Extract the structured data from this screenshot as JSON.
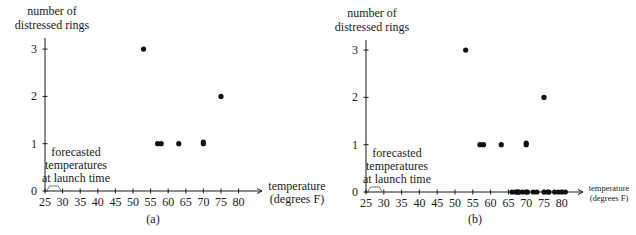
{
  "figure": {
    "panels": [
      {
        "caption": "(a)",
        "ylabel_lines": [
          "number of",
          "distressed rings"
        ],
        "xlabel_lines": [
          "temperature",
          "(degrees F)"
        ],
        "annotation_lines": [
          "forecasted",
          "temperatures",
          "at launch time"
        ],
        "forecast_range": [
          26,
          29
        ]
      },
      {
        "caption": "(b)",
        "ylabel_lines": [
          "number of",
          "distressed rings"
        ],
        "xlabel_lines": [
          "temperature",
          "(degrees F)"
        ],
        "annotation_lines": [
          "forecasted",
          "temperatures",
          "at launch time"
        ],
        "forecast_range": [
          26,
          29
        ]
      }
    ]
  },
  "chart_data": [
    {
      "type": "scatter",
      "title": "(a)",
      "xlabel": "temperature (degrees F)",
      "ylabel": "number of distressed rings",
      "xticks": [
        25,
        30,
        35,
        40,
        45,
        50,
        55,
        60,
        65,
        70,
        75,
        80
      ],
      "yticks": [
        0,
        1,
        2,
        3
      ],
      "xlim": [
        25,
        83
      ],
      "ylim": [
        0,
        3
      ],
      "grid": false,
      "annotation": "forecasted temperatures at launch time",
      "forecast_range": [
        26,
        29
      ],
      "points": [
        {
          "x": 53,
          "y": 3
        },
        {
          "x": 57,
          "y": 1
        },
        {
          "x": 58,
          "y": 1
        },
        {
          "x": 63,
          "y": 1
        },
        {
          "x": 70,
          "y": 1
        },
        {
          "x": 70,
          "y": 1
        },
        {
          "x": 75,
          "y": 2
        }
      ]
    },
    {
      "type": "scatter",
      "title": "(b)",
      "xlabel": "temperature (degrees F)",
      "ylabel": "number of distressed rings",
      "xticks": [
        25,
        30,
        35,
        40,
        45,
        50,
        55,
        60,
        65,
        70,
        75,
        80
      ],
      "yticks": [
        0,
        1,
        2,
        3
      ],
      "xlim": [
        25,
        83
      ],
      "ylim": [
        0,
        3
      ],
      "grid": false,
      "annotation": "forecasted temperatures at launch time",
      "forecast_range": [
        26,
        29
      ],
      "points": [
        {
          "x": 53,
          "y": 3
        },
        {
          "x": 57,
          "y": 1
        },
        {
          "x": 58,
          "y": 1
        },
        {
          "x": 63,
          "y": 1
        },
        {
          "x": 70,
          "y": 1
        },
        {
          "x": 70,
          "y": 1
        },
        {
          "x": 75,
          "y": 2
        },
        {
          "x": 66,
          "y": 0
        },
        {
          "x": 67,
          "y": 0
        },
        {
          "x": 67,
          "y": 0
        },
        {
          "x": 67,
          "y": 0
        },
        {
          "x": 68,
          "y": 0
        },
        {
          "x": 69,
          "y": 0
        },
        {
          "x": 70,
          "y": 0
        },
        {
          "x": 70,
          "y": 0
        },
        {
          "x": 72,
          "y": 0
        },
        {
          "x": 73,
          "y": 0
        },
        {
          "x": 75,
          "y": 0
        },
        {
          "x": 76,
          "y": 0
        },
        {
          "x": 76,
          "y": 0
        },
        {
          "x": 78,
          "y": 0
        },
        {
          "x": 79,
          "y": 0
        },
        {
          "x": 80,
          "y": 0
        },
        {
          "x": 81,
          "y": 0
        }
      ]
    }
  ]
}
